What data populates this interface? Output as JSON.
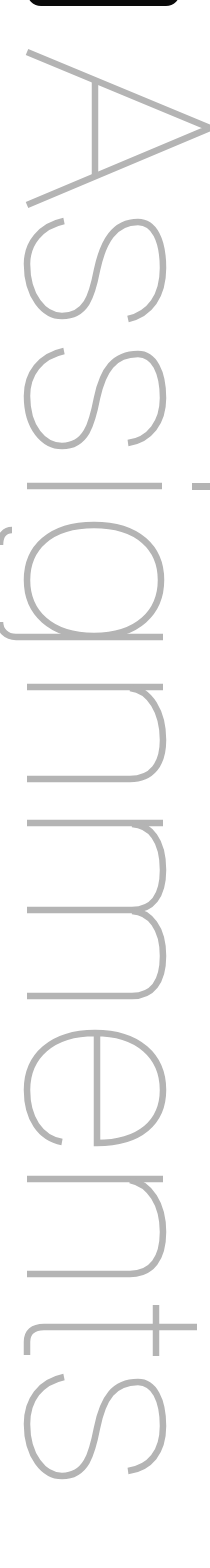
{
  "top_button": {
    "label": ""
  },
  "title": {
    "text": "Assignments",
    "orientation": "rotated-90-clockwise",
    "color": "#b4b4b4"
  },
  "colors": {
    "background": "#ffffff",
    "button": "#0a0a0a",
    "title_text": "#b4b4b4"
  }
}
